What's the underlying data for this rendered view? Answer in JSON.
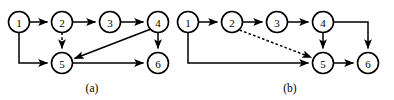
{
  "figure": {
    "name": "two-directed-graph-panels",
    "background_color": "#ffffff",
    "stroke_color": "#000000",
    "width": 394,
    "height": 100
  },
  "panels": [
    {
      "id": "a",
      "caption": "(a)",
      "caption_x": 92,
      "caption_y": 88,
      "nodes": [
        {
          "id": "a1",
          "label": "1",
          "cx": 19,
          "cy": 22,
          "r": 10.5
        },
        {
          "id": "a2",
          "label": "2",
          "cx": 62,
          "cy": 22,
          "r": 10.5
        },
        {
          "id": "a3",
          "label": "3",
          "cx": 110,
          "cy": 22,
          "r": 10.5
        },
        {
          "id": "a4",
          "label": "4",
          "cx": 158,
          "cy": 22,
          "r": 10.5
        },
        {
          "id": "a5",
          "label": "5",
          "cx": 62,
          "cy": 63,
          "r": 10.5
        },
        {
          "id": "a6",
          "label": "6",
          "cx": 158,
          "cy": 63,
          "r": 10.5
        }
      ],
      "edges": [
        {
          "id": "a-1-2",
          "from": "1",
          "to": "2",
          "style": "solid",
          "path": "M 29.5 22 L 47.5 22"
        },
        {
          "id": "a-2-3",
          "from": "2",
          "to": "3",
          "style": "solid",
          "path": "M 72.5 22 L 95.5 22"
        },
        {
          "id": "a-3-4",
          "from": "3",
          "to": "4",
          "style": "solid",
          "path": "M 120.5 22 L 143.5 22"
        },
        {
          "id": "a-1-5",
          "from": "1",
          "to": "5",
          "style": "solid",
          "path": "M 19 32.5 L 19 63 L 47.5 63"
        },
        {
          "id": "a-2-5",
          "from": "2",
          "to": "5",
          "style": "dashed",
          "path": "M 62 32.5 L 62 48.5"
        },
        {
          "id": "a-4-6",
          "from": "4",
          "to": "6",
          "style": "solid",
          "path": "M 158 32.5 L 158 48.5"
        },
        {
          "id": "a-4-5",
          "from": "4",
          "to": "5",
          "style": "solid",
          "path": "M 150.3 29.2 L 74.5 58.5"
        },
        {
          "id": "a-5-6",
          "from": "5",
          "to": "6",
          "style": "solid",
          "path": "M 72.5 63 L 143.5 63"
        }
      ]
    },
    {
      "id": "b",
      "caption": "(b)",
      "caption_x": 290,
      "caption_y": 88,
      "nodes": [
        {
          "id": "b1",
          "label": "1",
          "cx": 188,
          "cy": 22,
          "r": 10.5
        },
        {
          "id": "b2",
          "label": "2",
          "cx": 232,
          "cy": 22,
          "r": 10.5
        },
        {
          "id": "b3",
          "label": "3",
          "cx": 277,
          "cy": 22,
          "r": 10.5
        },
        {
          "id": "b4",
          "label": "4",
          "cx": 323,
          "cy": 22,
          "r": 10.5
        },
        {
          "id": "b5",
          "label": "5",
          "cx": 323,
          "cy": 63,
          "r": 10.5
        },
        {
          "id": "b6",
          "label": "6",
          "cx": 368,
          "cy": 63,
          "r": 10.5
        }
      ],
      "edges": [
        {
          "id": "b-1-2",
          "from": "1",
          "to": "2",
          "style": "solid",
          "path": "M 198.5 22 L 217.5 22"
        },
        {
          "id": "b-2-3",
          "from": "2",
          "to": "3",
          "style": "solid",
          "path": "M 242.5 22 L 262.5 22"
        },
        {
          "id": "b-3-4",
          "from": "3",
          "to": "4",
          "style": "solid",
          "path": "M 287.5 22 L 308.5 22"
        },
        {
          "id": "b-1-5",
          "from": "1",
          "to": "5",
          "style": "solid",
          "path": "M 188 32.5 L 188 63 L 308.5 63"
        },
        {
          "id": "b-2-5",
          "from": "2",
          "to": "5",
          "style": "dashed",
          "path": "M 239.6 30 L 311.5 57.5"
        },
        {
          "id": "b-4-5",
          "from": "4",
          "to": "5",
          "style": "solid",
          "path": "M 323 32.5 L 323 48.5"
        },
        {
          "id": "b-4-6",
          "from": "4",
          "to": "6",
          "style": "solid",
          "path": "M 333.5 22 L 368 22 L 368 48.5"
        },
        {
          "id": "b-5-6",
          "from": "5",
          "to": "6",
          "style": "solid",
          "path": "M 333.5 63 L 353.5 63"
        }
      ]
    }
  ]
}
